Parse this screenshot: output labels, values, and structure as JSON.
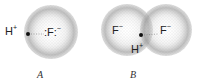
{
  "diagram": {
    "panels": [
      {
        "label": "A",
        "hydrogen": {
          "symbol": "H",
          "charge": "+"
        },
        "fluoride": {
          "symbol": "F",
          "charge": "−",
          "lone_pairs": ":F:"
        }
      },
      {
        "label": "B",
        "hydrogen": {
          "symbol": "H",
          "charge": "+"
        },
        "fluoride_left": {
          "symbol": "F",
          "charge": "−"
        },
        "fluoride_right": {
          "symbol": "F",
          "charge": "−"
        }
      }
    ],
    "colors": {
      "sphere_stipple": "#8a8a8a",
      "text": "#222222",
      "background": "#ffffff"
    }
  }
}
